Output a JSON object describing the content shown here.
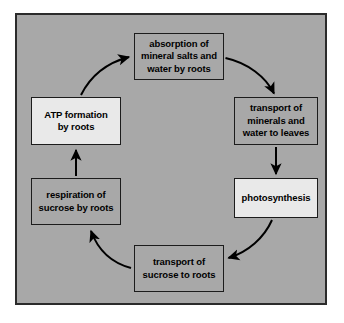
{
  "diagram": {
    "frame": {
      "background_color": "#a8a8a8",
      "border_color": "#2b2b2b",
      "page_background": "#ffffff"
    },
    "node_default_fill": "#a8a8a8",
    "node_highlight_fill": "#e9e9e9",
    "node_border_color": "#1c1c1c",
    "arrow_color": "#000000",
    "nodes": [
      {
        "id": "absorption",
        "label": "absorption of\nmineral salts and\nwater by roots",
        "fill": "#a8a8a8",
        "position": "top"
      },
      {
        "id": "transport_minerals",
        "label": "transport of\nminerals and\nwater to leaves",
        "fill": "#a8a8a8",
        "position": "right-upper"
      },
      {
        "id": "photosynthesis",
        "label": "photosynthesis",
        "fill": "#e9e9e9",
        "position": "right-lower"
      },
      {
        "id": "transport_sucrose",
        "label": "transport of\nsucrose to roots",
        "fill": "#a8a8a8",
        "position": "bottom"
      },
      {
        "id": "respiration",
        "label": "respiration of\nsucrose by roots",
        "fill": "#a8a8a8",
        "position": "left-lower"
      },
      {
        "id": "atp",
        "label": "ATP formation\nby roots",
        "fill": "#e9e9e9",
        "position": "left-upper"
      }
    ],
    "edges": [
      {
        "id": "absorption-to-transport-minerals",
        "from": "absorption",
        "to": "transport_minerals",
        "style": "curved"
      },
      {
        "id": "transport-minerals-to-photosynthesis",
        "from": "transport_minerals",
        "to": "photosynthesis",
        "style": "straight-down"
      },
      {
        "id": "photosynthesis-to-transport-sucrose",
        "from": "photosynthesis",
        "to": "transport_sucrose",
        "style": "curved"
      },
      {
        "id": "transport-sucrose-to-respiration",
        "from": "transport_sucrose",
        "to": "respiration",
        "style": "curved"
      },
      {
        "id": "respiration-to-atp",
        "from": "respiration",
        "to": "atp",
        "style": "straight-up"
      },
      {
        "id": "atp-to-absorption",
        "from": "atp",
        "to": "absorption",
        "style": "curved"
      }
    ]
  }
}
